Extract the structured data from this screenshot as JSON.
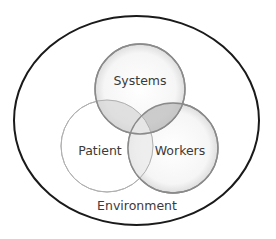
{
  "diagram": {
    "type": "venn",
    "container": {
      "label": "Environment",
      "shape": "ellipse",
      "stroke": "#1a1a1a"
    },
    "sets": [
      {
        "id": "systems",
        "label": "Systems",
        "shaded": true
      },
      {
        "id": "patient",
        "label": "Patient",
        "shaded": false
      },
      {
        "id": "workers",
        "label": "Workers",
        "shaded": true
      }
    ],
    "colors": {
      "circle_stroke": "#8a8a8a",
      "light_stroke": "#b0b0b0",
      "overlap_fill": "#bdbdbd",
      "text": "#3a3a3a"
    }
  }
}
